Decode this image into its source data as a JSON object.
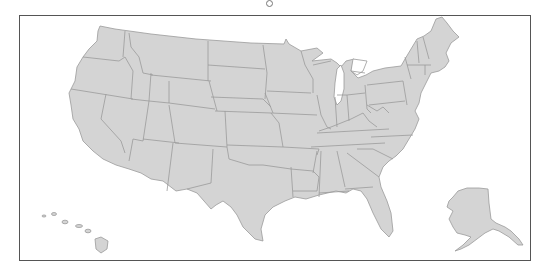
{
  "map": {
    "title": "",
    "region": "United States",
    "fill_color": "#d4d4d4",
    "border_color": "#9a9a9a",
    "frame_color": "#555555",
    "insets": [
      "Alaska",
      "Hawaii"
    ]
  },
  "rotate_handle": {
    "icon": "rotate-handle-icon"
  }
}
